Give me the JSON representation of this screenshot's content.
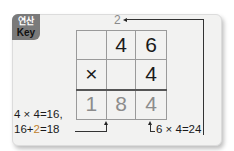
{
  "badge": {
    "korean": "연산",
    "english": "Key"
  },
  "carry": "2",
  "grid": {
    "rows": [
      [
        "",
        "4",
        "6"
      ],
      [
        "×",
        "",
        "4"
      ],
      [
        "1",
        "8",
        "4"
      ]
    ]
  },
  "notes": {
    "left_line1": "4 × 4=16,",
    "left_line2_a": "16+",
    "left_line2_hl": "2",
    "left_line2_b": "=18",
    "right": "6 × 4=24"
  },
  "colors": {
    "answer": "#8c8c8c",
    "highlight": "#c0812f",
    "badge": "#7a7a7a",
    "card": "#f2f2f1"
  }
}
